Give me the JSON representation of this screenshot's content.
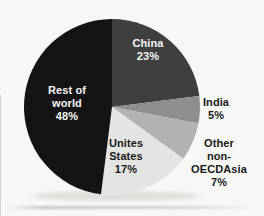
{
  "chart_data": {
    "type": "pie",
    "title": "",
    "start_angle_deg": 0,
    "direction": "clockwise",
    "legend_position": "none",
    "unit": "%",
    "slices": [
      {
        "label": "China",
        "value": 23,
        "color": "#3f3f3f",
        "label_color": "#f6f6f6",
        "label_placement": "inside"
      },
      {
        "label": "India",
        "value": 5,
        "color": "#8e8e8e",
        "label_color": "#1a1a1a",
        "label_placement": "outside"
      },
      {
        "label": "Other non-OECDAsia",
        "value": 7,
        "color": "#b2b2b0",
        "label_color": "#1a1a1a",
        "label_placement": "outside"
      },
      {
        "label": "Unites States",
        "value": 17,
        "color": "#e4e4e2",
        "label_color": "#1a1a1a",
        "label_placement": "inside"
      },
      {
        "label": "Rest of world",
        "value": 48,
        "color": "#141414",
        "label_color": "#f6f6f6",
        "label_placement": "inside"
      }
    ]
  },
  "labels": {
    "china": "China\n23%",
    "india": "India\n5%",
    "other": "Other non-\nOECDAsia\n7%",
    "us": "Unites\nStates\n17%",
    "rest": "Rest of\nworld\n48%"
  },
  "colors": {
    "background": "#f7f7f5",
    "shadow": "#c9c9c4"
  }
}
